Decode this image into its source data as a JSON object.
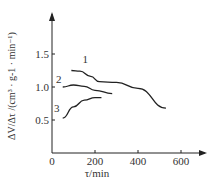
{
  "chart_data": {
    "type": "line",
    "title": "",
    "xlabel": "τ/min",
    "ylabel": "ΔV_a/Δτ /(cm³ · g-1 · min⁻¹)",
    "xlim": [
      0,
      700
    ],
    "ylim": [
      0,
      1.9
    ],
    "x_ticks": [
      "0",
      "200",
      "400",
      "600"
    ],
    "y_ticks": [
      "0.5",
      "1.0",
      "1.5"
    ],
    "grid": false,
    "legend": "inline numeric labels",
    "series": [
      {
        "name": "1",
        "x": [
          90,
          130,
          180,
          220,
          300,
          400,
          530
        ],
        "y": [
          1.25,
          1.24,
          1.16,
          1.08,
          1.07,
          0.98,
          0.68
        ]
      },
      {
        "name": "2",
        "x": [
          50,
          100,
          150,
          200,
          280
        ],
        "y": [
          1.0,
          1.03,
          1.01,
          0.95,
          0.9
        ]
      },
      {
        "name": "3",
        "x": [
          50,
          100,
          150,
          200,
          230
        ],
        "y": [
          0.53,
          0.7,
          0.8,
          0.84,
          0.84
        ]
      }
    ]
  },
  "labels": {
    "x_axis": "τ/min",
    "y_axis_num": "ΔV",
    "y_axis_den": "Δτ",
    "y_axis_unit": "/(cm³ · g-1 · min⁻¹)",
    "origin": "0"
  }
}
